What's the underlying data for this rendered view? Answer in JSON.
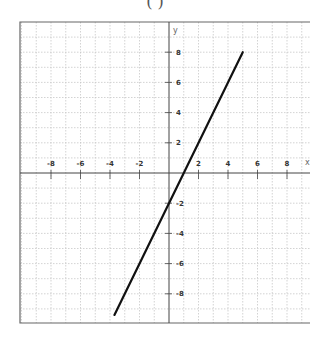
{
  "header": {
    "title": "(  )"
  },
  "chart_data": {
    "type": "line",
    "title": "",
    "xlabel": "x",
    "ylabel": "y",
    "xlim": [
      -10,
      10
    ],
    "ylim": [
      -10,
      10
    ],
    "grid": true,
    "x_ticks": [
      -8,
      -6,
      -4,
      -2,
      2,
      4,
      6,
      8
    ],
    "y_ticks": [
      8,
      6,
      4,
      2,
      -2,
      -4,
      -6,
      -8
    ],
    "x_tick_labels": [
      "-8",
      "-6",
      "-4",
      "-2",
      "2",
      "4",
      "6",
      "8"
    ],
    "y_tick_labels": [
      "8",
      "6",
      "4",
      "2",
      "-2",
      "-4",
      "-6",
      "-8"
    ],
    "series": [
      {
        "name": "y = 2x - 2",
        "equation": "y = 2x - 2",
        "x": [
          -3.7,
          5
        ],
        "y": [
          -9.4,
          8
        ],
        "color": "#111111"
      }
    ]
  },
  "layout": {
    "origin_px": [
      169,
      173
    ],
    "unit_px_x": 14.75,
    "unit_px_y": 15.1,
    "plot_box": [
      20,
      22,
      310,
      323
    ]
  },
  "colors": {
    "grid": "#c8c8c8",
    "axis": "#444444",
    "line": "#111111",
    "border": "#666666"
  }
}
